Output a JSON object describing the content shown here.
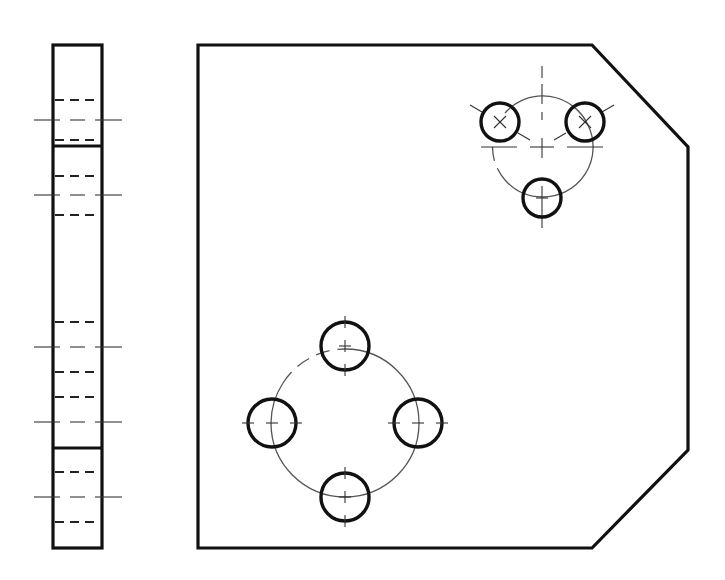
{
  "drawing": {
    "type": "orthographic engineering drawing",
    "views": [
      "side-view",
      "front-view"
    ],
    "colors": {
      "line": "#111111",
      "thin": "#444444",
      "background": "#ffffff"
    }
  },
  "side_view": {
    "x": 53,
    "y": 45,
    "width": 49,
    "height": 503,
    "section_lines_y": [
      146,
      448
    ],
    "hole_rows": [
      {
        "center_y": 120,
        "hidden_top": 100,
        "hidden_bottom": 140
      },
      {
        "center_y": 195,
        "hidden_top": 176,
        "hidden_bottom": 215
      },
      {
        "center_y": 347,
        "hidden_top": 322,
        "hidden_bottom": 372
      },
      {
        "center_y": 422,
        "hidden_top": 397,
        "hidden_bottom": 447
      },
      {
        "center_y": 497,
        "hidden_top": 472,
        "hidden_bottom": 522
      }
    ]
  },
  "front_view": {
    "outline_points": [
      [
        198,
        45
      ],
      [
        592,
        45
      ],
      [
        688,
        147
      ],
      [
        688,
        450
      ],
      [
        592,
        548
      ],
      [
        198,
        548
      ]
    ],
    "pattern_three_hole": {
      "center": [
        542,
        147
      ],
      "pcd_radius": 50,
      "hole_radius": 19,
      "holes": [
        [
          500,
          122
        ],
        [
          585,
          122
        ],
        [
          542,
          198
        ]
      ]
    },
    "pattern_four_hole": {
      "center": [
        345,
        423
      ],
      "pcd_radius": 74,
      "hole_radius": 24,
      "holes": [
        [
          345,
          347
        ],
        [
          272,
          423
        ],
        [
          418,
          423
        ],
        [
          345,
          497
        ]
      ]
    }
  }
}
